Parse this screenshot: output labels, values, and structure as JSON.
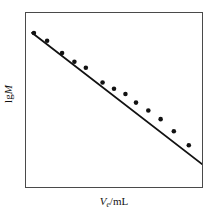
{
  "figure": {
    "background_color": "#ffffff",
    "frame_color": "#4a4a4a",
    "ink_color": "#121212"
  },
  "labels": {
    "ylabel_prefix": "lg",
    "ylabel_variable": "M",
    "xlabel_variable": "V",
    "xlabel_subscript": "e",
    "xlabel_separator": "/",
    "xlabel_unit": "mL"
  },
  "chart_data": {
    "type": "scatter",
    "title": "",
    "subtitle": "",
    "xlabel": "Ve/mL",
    "ylabel": "lgM",
    "xlim": [
      0,
      100
    ],
    "ylim": [
      0,
      100
    ],
    "grid": false,
    "legend": null,
    "axis_ticks": false,
    "axis_tick_labels": false,
    "marker": "filled-circle",
    "marker_color": "#121212",
    "marker_size_px": 4.6,
    "line": {
      "name": "linear calibration fit",
      "style": "solid",
      "color": "#121212",
      "width_px": 1.8,
      "x": [
        3.4,
        100.0
      ],
      "y": [
        88.6,
        13.2
      ]
    },
    "series": [
      {
        "name": "calibration points",
        "x": [
          4.5,
          12.0,
          20.5,
          27.5,
          34.0,
          43.5,
          50.0,
          56.5,
          62.5,
          69.5,
          76.5,
          84.0,
          92.5
        ],
        "y": [
          88.5,
          84.0,
          77.0,
          72.0,
          68.5,
          60.0,
          56.5,
          53.5,
          48.5,
          44.0,
          39.0,
          32.0,
          24.0
        ]
      }
    ]
  }
}
